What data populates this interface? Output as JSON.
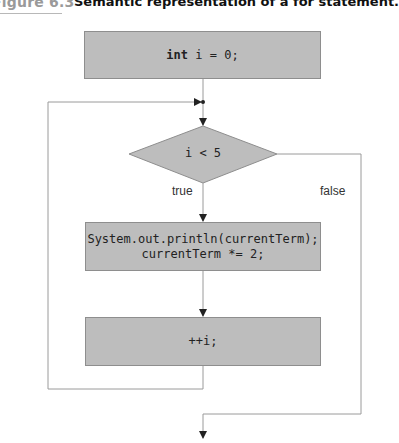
{
  "figure": {
    "number": "Figure 6.3",
    "title": "Semantic representation of a for statement."
  },
  "nodes": {
    "init": {
      "keyword": "int",
      "rest": " i = 0;"
    },
    "condition": {
      "label": "i < 5"
    },
    "body": {
      "line1": "System.out.println(currentTerm);",
      "line2": "currentTerm *= 2;"
    },
    "update": {
      "label": "++i;"
    }
  },
  "edges": {
    "true_label": "true",
    "false_label": "false"
  },
  "colors": {
    "node_fill": "#bdbdbd",
    "node_border": "#8e8e8e",
    "line": "#9a9a9a",
    "arrow": "#222222"
  }
}
